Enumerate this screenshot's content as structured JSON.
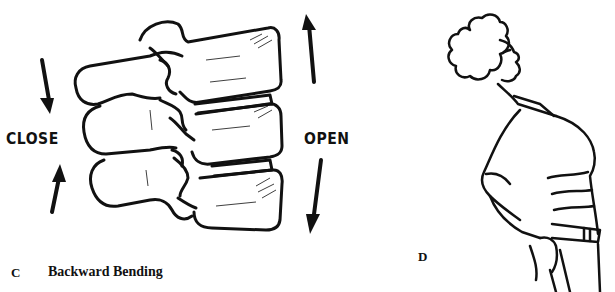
{
  "figure": {
    "panel_c": {
      "letter": "C",
      "title": "Backward Bending",
      "left_label": "CLOSE",
      "right_label": "OPEN",
      "illustration": "lumbar-vertebrae-side-view",
      "arrows": {
        "left_top": "arrow-down",
        "left_bottom": "arrow-up",
        "right_top": "arrow-up",
        "right_bottom": "arrow-down"
      }
    },
    "panel_d": {
      "letter": "D",
      "illustration": "woman-bending-backward"
    },
    "colors": {
      "ink": "#111111",
      "paper": "#ffffff"
    }
  }
}
